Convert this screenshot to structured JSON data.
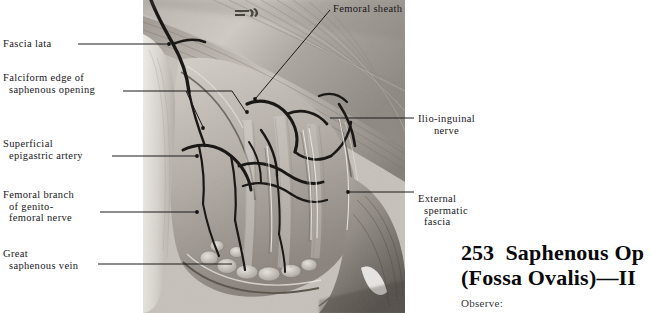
{
  "plate": {
    "number": "253",
    "title_line1": "Saphenous Op",
    "title_line2": "(Fossa Ovalis)—II",
    "observe_label": "Observe:"
  },
  "figure": {
    "name": "saphenous-opening-dissection-photograph"
  },
  "labels_left": [
    {
      "id": "fascia-lata",
      "lines": [
        "Fascia lata"
      ],
      "x": 3,
      "y": 38
    },
    {
      "id": "falciform-edge",
      "lines": [
        "Falciform edge of",
        "  saphenous opening"
      ],
      "x": 3,
      "y": 72
    },
    {
      "id": "superficial-epigastric-artery",
      "lines": [
        "Superficial",
        "  epigastric artery"
      ],
      "x": 3,
      "y": 138
    },
    {
      "id": "femoral-branch-genitofemoral",
      "lines": [
        "Femoral branch",
        "  of genito-",
        "  femoral nerve"
      ],
      "x": 3,
      "y": 189
    },
    {
      "id": "great-saphenous-vein",
      "lines": [
        "Great",
        "  saphenous vein"
      ],
      "x": 3,
      "y": 248
    }
  ],
  "labels_right": [
    {
      "id": "femoral-sheath",
      "lines": [
        "Femoral sheath"
      ],
      "x": 333,
      "y": 3
    },
    {
      "id": "ilio-inguinal-nerve",
      "lines": [
        "Ilio-inguinal",
        "nerve"
      ],
      "x": 418,
      "y": 113
    },
    {
      "id": "external-spermatic-fascia",
      "lines": [
        "External",
        "  spermatic",
        "  fascia"
      ],
      "x": 418,
      "y": 193
    }
  ],
  "colors": {
    "text": "#18161a",
    "leader": "#1a1a1a",
    "page_background": "#ffffff"
  }
}
